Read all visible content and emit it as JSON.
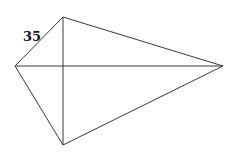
{
  "figure": {
    "type": "kite",
    "vertices": {
      "left": {
        "x": 15,
        "y": 66
      },
      "top": {
        "x": 63,
        "y": 17
      },
      "right": {
        "x": 223,
        "y": 66
      },
      "bottom": {
        "x": 63,
        "y": 145
      }
    },
    "edges": [
      {
        "from": "left",
        "to": "top"
      },
      {
        "from": "top",
        "to": "right"
      },
      {
        "from": "right",
        "to": "bottom"
      },
      {
        "from": "bottom",
        "to": "left"
      }
    ],
    "diagonals": [
      {
        "from": "left",
        "to": "right"
      },
      {
        "from": "top",
        "to": "bottom"
      }
    ],
    "labels": [
      {
        "text": "35",
        "x": 23,
        "y": 41,
        "edge": "left-top"
      }
    ],
    "colors": {
      "stroke": "#3a3a3a",
      "text": "#1a1a1a",
      "background": "#ffffff"
    }
  }
}
